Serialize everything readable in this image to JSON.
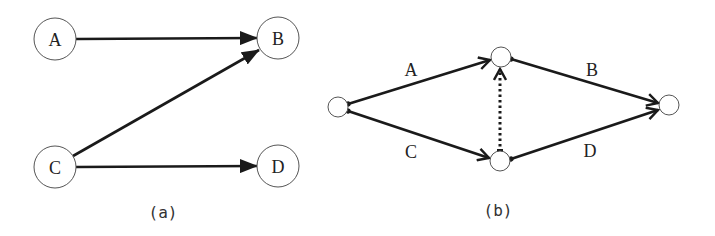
{
  "colors": {
    "line": "#1a1a1a",
    "node_stroke": "#555555",
    "text": "#222222",
    "background": "#ffffff"
  },
  "panel_a": {
    "caption": "(a)",
    "nodes": [
      {
        "id": "A",
        "label": "A",
        "cx": 55,
        "cy": 39,
        "r": 21
      },
      {
        "id": "B",
        "label": "B",
        "cx": 278,
        "cy": 38,
        "r": 21
      },
      {
        "id": "C",
        "label": "C",
        "cx": 55,
        "cy": 167,
        "r": 21
      },
      {
        "id": "D",
        "label": "D",
        "cx": 278,
        "cy": 166,
        "r": 21
      }
    ],
    "edges": [
      {
        "from": "A",
        "to": "B"
      },
      {
        "from": "C",
        "to": "B"
      },
      {
        "from": "C",
        "to": "D"
      }
    ]
  },
  "panel_b": {
    "caption": "(b)",
    "nodes": [
      {
        "id": "n1",
        "cx": 338,
        "cy": 107,
        "r": 10
      },
      {
        "id": "n2",
        "cx": 501,
        "cy": 57,
        "r": 10
      },
      {
        "id": "n3",
        "cx": 500,
        "cy": 161,
        "r": 10
      },
      {
        "id": "n4",
        "cx": 669,
        "cy": 105,
        "r": 10
      }
    ],
    "edges": [
      {
        "from": "n1",
        "to": "n2",
        "label": "A",
        "style": "solid"
      },
      {
        "from": "n2",
        "to": "n4",
        "label": "B",
        "style": "solid"
      },
      {
        "from": "n1",
        "to": "n3",
        "label": "C",
        "style": "solid"
      },
      {
        "from": "n3",
        "to": "n4",
        "label": "D",
        "style": "solid"
      },
      {
        "from": "n3",
        "to": "n2",
        "label": "",
        "style": "dotted",
        "note": "dummy activity"
      }
    ],
    "edge_labels": {
      "A": "A",
      "B": "B",
      "C": "C",
      "D": "D"
    }
  }
}
